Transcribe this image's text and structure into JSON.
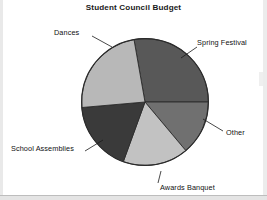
{
  "figure": {
    "title": "Student Council Budget",
    "background_color": "#ffffff"
  },
  "labels": {
    "dances": "Dances",
    "spring_festival": "Spring Festival",
    "other": "Other",
    "awards_banquet": "Awards Banquet",
    "school_assemblies": "School Assemblies"
  },
  "chart_data": {
    "type": "pie",
    "title": "Student Council Budget",
    "xlabel": "",
    "ylabel": "",
    "legend_position": "none",
    "labels_position": "outside-with-leader-lines",
    "grid": false,
    "start_angle_deg": 350,
    "direction": "clockwise",
    "categories": [
      "Spring Festival",
      "Other",
      "Awards Banquet",
      "School Assemblies",
      "Dances"
    ],
    "values": [
      28,
      14,
      17,
      18,
      23
    ],
    "units": "percent",
    "slices": [
      {
        "label": "Spring Festival",
        "value": 28,
        "angle_deg": 100,
        "start_deg": 350,
        "end_deg": 90,
        "color": "#585858"
      },
      {
        "label": "Other",
        "value": 14,
        "angle_deg": 50,
        "start_deg": 90,
        "end_deg": 140,
        "color": "#707070"
      },
      {
        "label": "Awards Banquet",
        "value": 17,
        "angle_deg": 60,
        "start_deg": 140,
        "end_deg": 200,
        "color": "#c2c2c2"
      },
      {
        "label": "School Assemblies",
        "value": 18,
        "angle_deg": 65,
        "start_deg": 200,
        "end_deg": 265,
        "color": "#3a3a3a"
      },
      {
        "label": "Dances",
        "value": 23,
        "angle_deg": 85,
        "start_deg": 265,
        "end_deg": 350,
        "color": "#b8b8b8"
      }
    ]
  }
}
